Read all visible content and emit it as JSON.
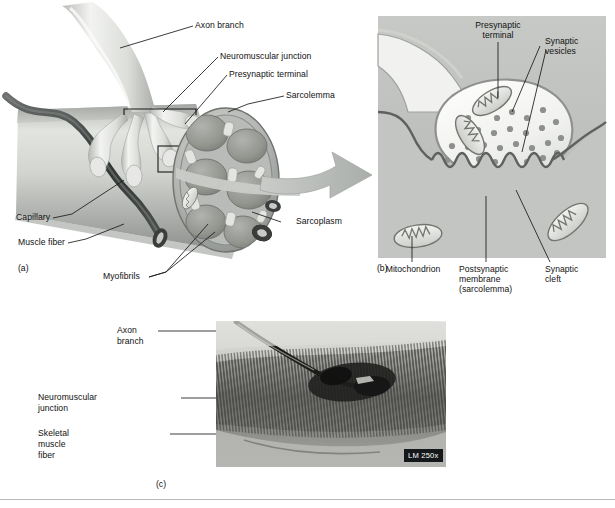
{
  "figure": {
    "title": "Neuromuscular junction",
    "panels": [
      "(a)",
      "(b)",
      "(c)"
    ]
  },
  "panel_a": {
    "id": "(a)",
    "labels": {
      "axon_branch": "Axon branch",
      "neuromuscular_junction": "Neuromuscular junction",
      "presynaptic_terminal": "Presynaptic terminal",
      "sarcolemma": "Sarcolemma",
      "sarcoplasm": "Sarcoplasm",
      "capillary": "Capillary",
      "muscle_fiber": "Muscle fiber",
      "myofibrils": "Myofibrils"
    }
  },
  "panel_b": {
    "id": "(b)",
    "labels": {
      "presynaptic_terminal_l1": "Presynaptic",
      "presynaptic_terminal_l2": "terminal",
      "synaptic_vesicles_l1": "Synaptic",
      "synaptic_vesicles_l2": "vesicles",
      "mitochondrion": "Mitochondrion",
      "postsynaptic_membrane_l1": "Postsynaptic",
      "postsynaptic_membrane_l2": "membrane",
      "postsynaptic_membrane_l3": "(sarcolemma)",
      "synaptic_cleft_l1": "Synaptic",
      "synaptic_cleft_l2": "cleft"
    }
  },
  "panel_c": {
    "id": "(c)",
    "labels": {
      "axon_branch_l1": "Axon",
      "axon_branch_l2": "branch",
      "neuromuscular_junction_l1": "Neuromuscular",
      "neuromuscular_junction_l2": "junction",
      "skeletal_muscle_fiber_l1": "Skeletal",
      "skeletal_muscle_fiber_l2": "muscle",
      "skeletal_muscle_fiber_l3": "fiber"
    },
    "magnification": "LM 250x"
  },
  "colors": {
    "background": "#ffffff",
    "leader_line": "#1a1a1a",
    "text": "#111111",
    "muscle_fiber_light": "#d9dbd8",
    "muscle_fiber_mid": "#a9aca8",
    "muscle_fiber_dark": "#7d817e",
    "axon_light": "#ececea",
    "axon_mid": "#c6c8c4",
    "myofibril_fill": "#9a9d99",
    "capillary_dark": "#3c3f3e",
    "panel_b_field": "#bfc2be",
    "terminal_fill": "#f2f3f1",
    "vesicle": "#8d918d",
    "badge_bg": "#15181a",
    "footer_rule": "#b9bbbd"
  }
}
